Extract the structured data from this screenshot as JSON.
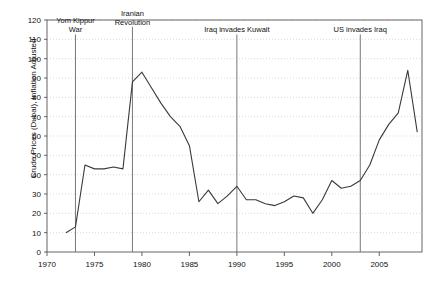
{
  "chart_data": {
    "type": "line",
    "title": "",
    "subtitle": "",
    "xlabel": "",
    "ylabel": "Crude Prices (Dubai), Inflation Adjusted",
    "xlim": [
      1970,
      2009.5
    ],
    "ylim": [
      0,
      120
    ],
    "xticks": [
      1970,
      1975,
      1980,
      1985,
      1990,
      1995,
      2000,
      2005
    ],
    "xtick_labels": [
      "1970",
      "1975",
      "1980",
      "1985",
      "1990",
      "1995",
      "2000",
      "2005"
    ],
    "yticks": [
      0,
      10,
      20,
      30,
      40,
      50,
      60,
      70,
      80,
      90,
      100,
      110,
      120
    ],
    "ytick_labels": [
      "0",
      "10",
      "20",
      "30",
      "40",
      "50",
      "60",
      "70",
      "80",
      "90",
      "100",
      "110",
      "120"
    ],
    "grid": "horizontal-dotted",
    "legend": "none",
    "line_color": "#3a3a3a",
    "grid_color": "#bdbdbd",
    "axis_color": "#555555",
    "series": [
      {
        "name": "Crude Prices (Dubai), Inflation Adjusted",
        "x": [
          1972,
          1973,
          1974,
          1975,
          1976,
          1977,
          1978,
          1979,
          1980,
          1981,
          1982,
          1983,
          1984,
          1985,
          1986,
          1987,
          1988,
          1989,
          1990,
          1991,
          1992,
          1993,
          1994,
          1995,
          1996,
          1997,
          1998,
          1999,
          2000,
          2001,
          2002,
          2003,
          2004,
          2005,
          2006,
          2007,
          2008,
          2009
        ],
        "y": [
          10,
          13,
          45,
          43,
          43,
          44,
          43,
          88,
          93,
          85,
          77,
          70,
          65,
          55,
          26,
          32,
          25,
          29,
          34,
          27,
          27,
          25,
          24,
          26,
          29,
          28,
          20,
          27,
          37,
          33,
          34,
          37,
          45,
          58,
          66,
          72,
          94,
          62
        ]
      }
    ],
    "annotations": [
      {
        "label": "Yom Kippur\nWar",
        "x": 1973,
        "label_y": 112
      },
      {
        "label": "Iranian\nRevolution",
        "x": 1979,
        "label_y": 116
      },
      {
        "label": "Iraq invades Kuwait",
        "x": 1990,
        "label_y": 112
      },
      {
        "label": "US invades Iraq",
        "x": 2003,
        "label_y": 112
      }
    ]
  }
}
